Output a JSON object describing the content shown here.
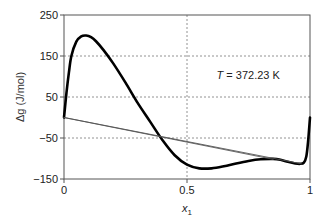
{
  "chart_data": {
    "type": "line",
    "title": "",
    "xlabel": "x1",
    "xlabel_main": "x",
    "xlabel_sub": "1",
    "ylabel": "Δg (J/mol)",
    "xlim": [
      0,
      1
    ],
    "ylim": [
      -150,
      250
    ],
    "xticks": [
      0,
      0.5,
      1
    ],
    "xtick_labels": [
      "0",
      "0.5",
      "1"
    ],
    "yticks": [
      -150,
      -50,
      50,
      150,
      250
    ],
    "ytick_labels": [
      "-150",
      "-50",
      "50",
      "150",
      "250"
    ],
    "grid": {
      "horizontal_dashed_at": [
        -50,
        50,
        150
      ],
      "vertical_dashed_at": [
        0.5
      ]
    },
    "legend": null,
    "annotation": {
      "italic": "T",
      "text": " = 372.23 K",
      "x": 0.62,
      "y": 95
    },
    "series": [
      {
        "name": "Δg curve",
        "style": "thick-black",
        "x": [
          0,
          0.01,
          0.02,
          0.03,
          0.05,
          0.07,
          0.09,
          0.11,
          0.13,
          0.16,
          0.2,
          0.25,
          0.3,
          0.35,
          0.4,
          0.45,
          0.5,
          0.55,
          0.6,
          0.65,
          0.7,
          0.75,
          0.8,
          0.85,
          0.88,
          0.91,
          0.94,
          0.96,
          0.975,
          0.985,
          0.992,
          1.0
        ],
        "values": [
          0,
          60,
          110,
          150,
          185,
          198,
          200,
          196,
          186,
          165,
          132,
          85,
          35,
          -10,
          -55,
          -92,
          -115,
          -124,
          -124,
          -119,
          -112,
          -106,
          -102,
          -101,
          -103,
          -108,
          -112,
          -113,
          -110,
          -95,
          -60,
          0
        ]
      },
      {
        "name": "tangent line 1",
        "style": "thin-gray",
        "x": [
          0,
          0.85
        ],
        "values": [
          0,
          -102
        ]
      },
      {
        "name": "tangent line 2",
        "style": "thin-gray",
        "x": [
          0,
          0.965
        ],
        "values": [
          0,
          -113
        ]
      }
    ],
    "colors": {
      "curve": "#000000",
      "tangent": "#555555",
      "grid": "#777777",
      "axis": "#555555"
    }
  }
}
